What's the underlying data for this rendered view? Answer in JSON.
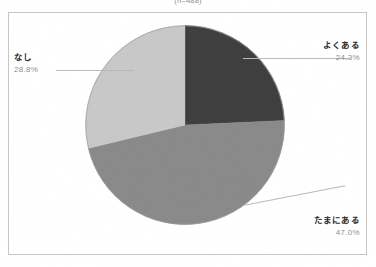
{
  "caption": "(n=488)",
  "colors": {
    "wedge_dark": "#3f3f3f",
    "wedge_mid": "#8a8a8a",
    "wedge_light": "#c8c8c8",
    "frame": "#c6c6c6",
    "leader": "#b9b9b9",
    "label_text": "#2b2b2b",
    "pct_text": "#8f8f8f",
    "background": "#ffffff"
  },
  "chart_data": {
    "type": "pie",
    "title": "(n=488)",
    "categories": [
      "よくある",
      "たまにある",
      "なし"
    ],
    "values": [
      24.3,
      47.0,
      28.8
    ],
    "unit": "%",
    "start_angle_deg": 0,
    "direction": "clockwise",
    "legend": "none",
    "grid": false,
    "slices": [
      {
        "label": "よくある",
        "value": 24.3,
        "display": "24.3%",
        "color": "#3f3f3f",
        "label_side": "right"
      },
      {
        "label": "たまにある",
        "value": 47.0,
        "display": "47.0%",
        "color": "#8a8a8a",
        "label_side": "right"
      },
      {
        "label": "なし",
        "value": 28.8,
        "display": "28.8%",
        "color": "#c8c8c8",
        "label_side": "left"
      }
    ]
  }
}
